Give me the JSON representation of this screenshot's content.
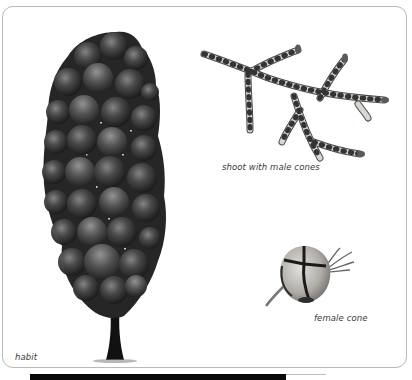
{
  "plate": {
    "labels": {
      "habit": "habit",
      "shoot": "shoot with male cones",
      "female_cone": "female cone"
    },
    "illustrations": [
      {
        "name": "tree-habit",
        "label_ref": "habit"
      },
      {
        "name": "shoot-with-male-cones",
        "label_ref": "shoot"
      },
      {
        "name": "female-cone",
        "label_ref": "female_cone"
      }
    ]
  },
  "colors": {
    "border": "#b9b9b9",
    "foliage_dark": "#2b2b2b",
    "foliage_mid": "#4a4a4a",
    "foliage_light": "#7a7a7a",
    "trunk": "#111111",
    "shoot_fill": "#d6d3cd",
    "shoot_band": "#3b3b3b",
    "bar": "#0a0a0a",
    "label": "#3a3a3a"
  }
}
